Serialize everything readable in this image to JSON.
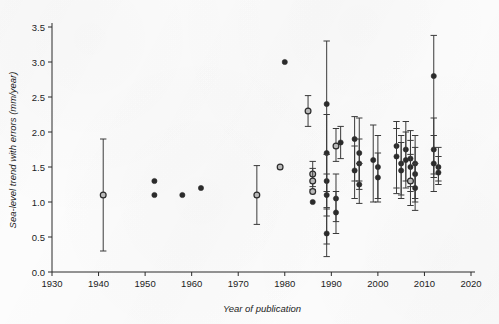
{
  "chart_data": {
    "type": "scatter",
    "title": "",
    "xlabel": "Year of publication",
    "ylabel": "Sea-level trend with errors (mm/year)",
    "xlim": [
      1930,
      2020
    ],
    "ylim": [
      0.0,
      3.5
    ],
    "xticks": [
      1930,
      1940,
      1950,
      1960,
      1970,
      1980,
      1990,
      2000,
      2010,
      2020
    ],
    "xticklabels": [
      "1930",
      "1940",
      "1950",
      "1960",
      "1970",
      "1980",
      "1990",
      "2000",
      "2010",
      "2020"
    ],
    "yticks": [
      0.0,
      0.5,
      1.0,
      1.5,
      2.0,
      2.5,
      3.0,
      3.5
    ],
    "yticklabels": [
      "0.0",
      "0.5",
      "1.0",
      "1.5",
      "2.0",
      "2.5",
      "3.0",
      "3.5"
    ],
    "grid": false,
    "legend": "none",
    "marker_styles": {
      "filled": "filled-circle",
      "open": "open-circle"
    },
    "errorbar_orientation": "vertical",
    "points": [
      {
        "x": 1941,
        "y": 1.1,
        "lo": 0.3,
        "hi": 1.9,
        "marker": "open"
      },
      {
        "x": 1952,
        "y": 1.3,
        "lo": 1.3,
        "hi": 1.3,
        "marker": "filled"
      },
      {
        "x": 1952,
        "y": 1.1,
        "lo": 1.1,
        "hi": 1.1,
        "marker": "filled"
      },
      {
        "x": 1958,
        "y": 1.1,
        "lo": 1.1,
        "hi": 1.1,
        "marker": "filled"
      },
      {
        "x": 1962,
        "y": 1.2,
        "lo": 1.2,
        "hi": 1.2,
        "marker": "filled"
      },
      {
        "x": 1974,
        "y": 1.1,
        "lo": 0.68,
        "hi": 1.52,
        "marker": "open"
      },
      {
        "x": 1979,
        "y": 1.5,
        "lo": 1.5,
        "hi": 1.5,
        "marker": "open"
      },
      {
        "x": 1980,
        "y": 3.0,
        "lo": 3.0,
        "hi": 3.0,
        "marker": "filled"
      },
      {
        "x": 1985,
        "y": 2.3,
        "lo": 2.08,
        "hi": 2.52,
        "marker": "open"
      },
      {
        "x": 1986,
        "y": 1.4,
        "lo": 1.22,
        "hi": 1.58,
        "marker": "open"
      },
      {
        "x": 1986,
        "y": 1.3,
        "lo": 1.18,
        "hi": 1.48,
        "marker": "open"
      },
      {
        "x": 1986,
        "y": 1.15,
        "lo": 1.15,
        "hi": 1.15,
        "marker": "open"
      },
      {
        "x": 1986,
        "y": 1.0,
        "lo": 1.0,
        "hi": 1.0,
        "marker": "filled"
      },
      {
        "x": 1989,
        "y": 2.4,
        "lo": 0.4,
        "hi": 3.3,
        "marker": "filled"
      },
      {
        "x": 1989,
        "y": 1.7,
        "lo": 1.15,
        "hi": 2.25,
        "marker": "filled"
      },
      {
        "x": 1989,
        "y": 1.3,
        "lo": 0.92,
        "hi": 1.68,
        "marker": "filled"
      },
      {
        "x": 1989,
        "y": 1.1,
        "lo": 0.8,
        "hi": 1.4,
        "marker": "filled"
      },
      {
        "x": 1989,
        "y": 0.55,
        "lo": 0.22,
        "hi": 0.9,
        "marker": "filled"
      },
      {
        "x": 1991,
        "y": 1.8,
        "lo": 1.58,
        "hi": 2.05,
        "marker": "open"
      },
      {
        "x": 1992,
        "y": 1.85,
        "lo": 1.62,
        "hi": 2.08,
        "marker": "filled"
      },
      {
        "x": 1991,
        "y": 1.05,
        "lo": 0.72,
        "hi": 1.4,
        "marker": "filled"
      },
      {
        "x": 1991,
        "y": 0.85,
        "lo": 0.55,
        "hi": 1.15,
        "marker": "filled"
      },
      {
        "x": 1995,
        "y": 1.9,
        "lo": 1.3,
        "hi": 2.22,
        "marker": "filled"
      },
      {
        "x": 1996,
        "y": 1.7,
        "lo": 1.3,
        "hi": 2.2,
        "marker": "filled"
      },
      {
        "x": 1996,
        "y": 1.55,
        "lo": 1.18,
        "hi": 1.9,
        "marker": "filled"
      },
      {
        "x": 1995,
        "y": 1.45,
        "lo": 1.05,
        "hi": 1.8,
        "marker": "filled"
      },
      {
        "x": 1996,
        "y": 1.25,
        "lo": 0.98,
        "hi": 1.55,
        "marker": "filled"
      },
      {
        "x": 1999,
        "y": 1.6,
        "lo": 1.0,
        "hi": 2.1,
        "marker": "filled"
      },
      {
        "x": 2000,
        "y": 1.5,
        "lo": 1.05,
        "hi": 1.95,
        "marker": "filled"
      },
      {
        "x": 2000,
        "y": 1.35,
        "lo": 1.0,
        "hi": 1.7,
        "marker": "filled"
      },
      {
        "x": 2004,
        "y": 1.8,
        "lo": 1.2,
        "hi": 2.15,
        "marker": "filled"
      },
      {
        "x": 2004,
        "y": 1.65,
        "lo": 1.12,
        "hi": 2.05,
        "marker": "filled"
      },
      {
        "x": 2005,
        "y": 1.55,
        "lo": 1.1,
        "hi": 1.95,
        "marker": "filled"
      },
      {
        "x": 2005,
        "y": 1.45,
        "lo": 1.05,
        "hi": 1.85,
        "marker": "filled"
      },
      {
        "x": 2006,
        "y": 1.75,
        "lo": 1.3,
        "hi": 2.15,
        "marker": "filled"
      },
      {
        "x": 2006,
        "y": 1.6,
        "lo": 1.2,
        "hi": 2.0,
        "marker": "filled"
      },
      {
        "x": 2007,
        "y": 1.62,
        "lo": 1.22,
        "hi": 2.02,
        "marker": "filled"
      },
      {
        "x": 2007,
        "y": 1.5,
        "lo": 1.15,
        "hi": 1.88,
        "marker": "filled"
      },
      {
        "x": 2007,
        "y": 1.3,
        "lo": 0.95,
        "hi": 1.68,
        "marker": "open"
      },
      {
        "x": 2008,
        "y": 1.55,
        "lo": 1.05,
        "hi": 1.95,
        "marker": "filled"
      },
      {
        "x": 2008,
        "y": 1.4,
        "lo": 1.0,
        "hi": 1.78,
        "marker": "filled"
      },
      {
        "x": 2008,
        "y": 1.2,
        "lo": 0.88,
        "hi": 1.55,
        "marker": "filled"
      },
      {
        "x": 2012,
        "y": 2.8,
        "lo": 1.35,
        "hi": 3.38,
        "marker": "filled"
      },
      {
        "x": 2012,
        "y": 1.75,
        "lo": 1.4,
        "hi": 2.2,
        "marker": "filled"
      },
      {
        "x": 2012,
        "y": 1.55,
        "lo": 1.15,
        "hi": 1.95,
        "marker": "filled"
      },
      {
        "x": 2013,
        "y": 1.5,
        "lo": 1.3,
        "hi": 1.78,
        "marker": "filled"
      },
      {
        "x": 2013,
        "y": 1.42,
        "lo": 1.25,
        "hi": 1.65,
        "marker": "filled"
      }
    ]
  }
}
